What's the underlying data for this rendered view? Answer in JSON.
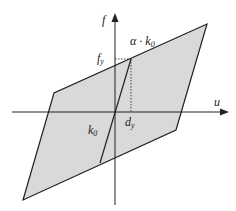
{
  "diagram": {
    "type": "bilinear hysteresis loop",
    "colors": {
      "fill": "#d9d9d9",
      "stroke": "#222222",
      "background": "#ffffff"
    },
    "axes": {
      "x_label": "u",
      "y_label": "f"
    },
    "labels": {
      "alpha_k0": "α · k",
      "alpha_k0_sub": "0",
      "fy": "f",
      "fy_sub": "y",
      "dy": "d",
      "dy_sub": "y",
      "k0": "k",
      "k0_sub": "0"
    }
  }
}
